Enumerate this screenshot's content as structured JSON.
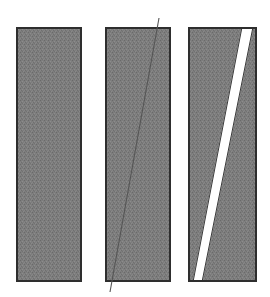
{
  "figure": {
    "canvas": {
      "width": 270,
      "height": 297,
      "background": "#ffffff"
    },
    "colors": {
      "fill_gray": "#7d7d7d",
      "fill_gray_dark": "#6e6e6e",
      "border_dark": "#2e2e2e",
      "cut_white": "#ffffff",
      "hairline": "#555555"
    },
    "panels": [
      {
        "id": "panel-1",
        "label": "undeformed-block",
        "x": 17,
        "y": 28,
        "width": 64,
        "height": 253,
        "fill": "#7d7d7d",
        "stroke": "#2e2e2e",
        "stroke_width": 2,
        "annotation": "solid rectangular block, no cut",
        "cut": null
      },
      {
        "id": "panel-2",
        "label": "block-with-hairline-cut",
        "x": 106,
        "y": 28,
        "width": 64,
        "height": 253,
        "fill": "#7d7d7d",
        "stroke": "#2e2e2e",
        "stroke_width": 2,
        "annotation": "rectangular block crossed by a thin diagonal line",
        "cut": {
          "type": "hairline",
          "stroke": "#555555",
          "stroke_width": 1,
          "top_x": 159,
          "top_y": 18,
          "bottom_x": 110,
          "bottom_y": 292
        }
      },
      {
        "id": "panel-3",
        "label": "block-with-open-wedge",
        "x": 189,
        "y": 28,
        "width": 67,
        "height": 253,
        "fill": "#7d7d7d",
        "stroke": "#2e2e2e",
        "stroke_width": 2,
        "annotation": "rectangular block split by a wide white diagonal wedge",
        "cut": {
          "type": "wedge",
          "fill": "#ffffff",
          "stroke": "#2e2e2e",
          "stroke_width": 1,
          "top_left_x": 242,
          "top_right_x": 253,
          "top_y": 28,
          "bottom_left_x": 193,
          "bottom_right_x": 202,
          "bottom_y": 281
        }
      }
    ]
  }
}
